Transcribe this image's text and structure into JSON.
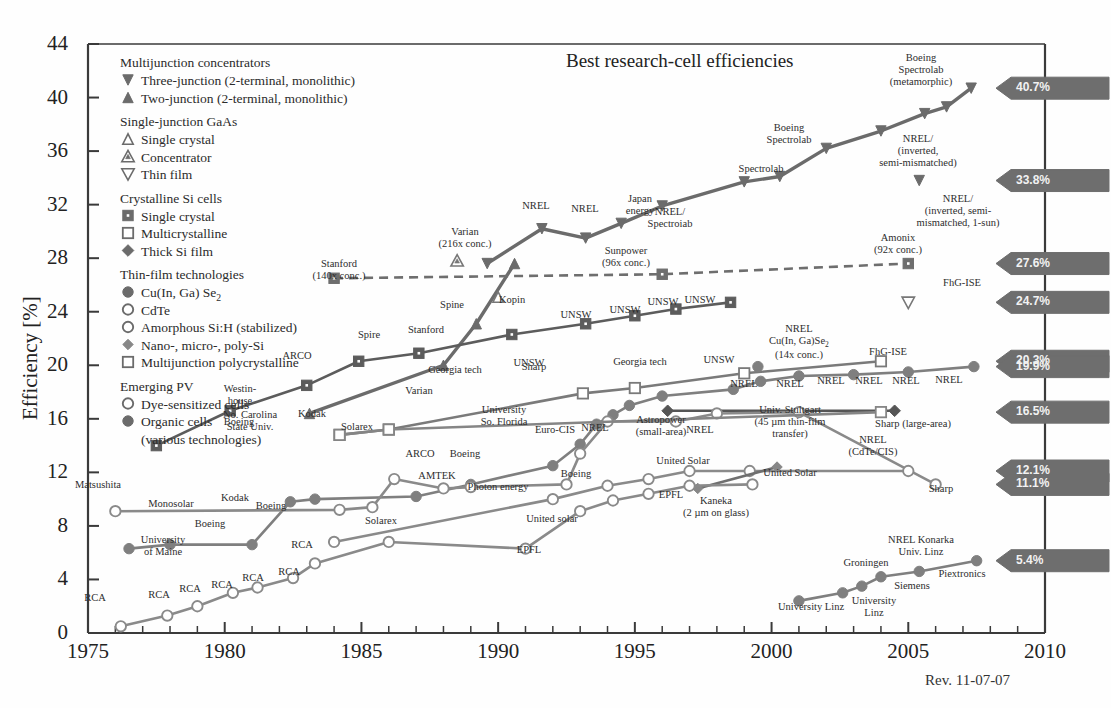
{
  "chart_data": {
    "type": "line",
    "title": "Best research-cell efficiencies",
    "xlabel": "",
    "ylabel": "Efficiency [%]",
    "xlim": [
      1975,
      2010
    ],
    "ylim": [
      0,
      44
    ],
    "xticks": [
      "1975",
      "1980",
      "1985",
      "1990",
      "1995",
      "2000",
      "2005",
      "2010"
    ],
    "yticks": [
      "0",
      "4",
      "8",
      "12",
      "16",
      "20",
      "24",
      "28",
      "32",
      "36",
      "40",
      "44"
    ],
    "revision": "Rev. 11-07-07",
    "grid": false,
    "legend_position": "upper-left-inside",
    "series": [
      {
        "name": "Three-junction (2-terminal, monolithic)",
        "marker": "triangle-down-filled",
        "color": "#6b6b6b",
        "points": [
          [
            1989.6,
            27.6
          ],
          [
            1991.6,
            30.2
          ],
          [
            1993.2,
            29.5
          ],
          [
            1994.5,
            30.6
          ],
          [
            1996.0,
            31.9
          ],
          [
            1999.0,
            33.7
          ],
          [
            2000.3,
            34.1
          ],
          [
            2002.0,
            36.2
          ],
          [
            2004.0,
            37.5
          ],
          [
            2005.6,
            38.8
          ],
          [
            2006.4,
            39.3
          ],
          [
            2007.3,
            40.7
          ],
          [
            2005.4,
            33.8
          ]
        ]
      },
      {
        "name": "Two-junction (2-terminal, monolithic)",
        "marker": "triangle-up-filled",
        "color": "#6b6b6b",
        "points": [
          [
            1983.1,
            16.4
          ],
          [
            1988.0,
            20.0
          ],
          [
            1989.2,
            23.1
          ],
          [
            1990.6,
            27.6
          ]
        ]
      },
      {
        "name": "Single crystal GaAs",
        "marker": "triangle-up-open",
        "color": "#777777",
        "points": [
          [
            1990.0,
            25.1
          ]
        ]
      },
      {
        "name": "GaAs Concentrator",
        "marker": "triangle-up-open-dot",
        "color": "#777777",
        "points": [
          [
            1988.5,
            27.8
          ]
        ]
      },
      {
        "name": "GaAs Thin film",
        "marker": "triangle-down-open",
        "color": "#777777",
        "points": [
          [
            2005.0,
            24.7
          ]
        ]
      },
      {
        "name": "Si Single crystal",
        "marker": "square-filled",
        "color": "#5c5c5c",
        "points": [
          [
            1977.5,
            14.0
          ],
          [
            1980.2,
            16.6
          ],
          [
            1983.0,
            18.5
          ],
          [
            1984.9,
            20.3
          ],
          [
            1987.1,
            20.9
          ],
          [
            1990.5,
            22.3
          ],
          [
            1993.2,
            23.1
          ],
          [
            1995.0,
            23.7
          ],
          [
            1996.5,
            24.2
          ],
          [
            1998.5,
            24.7
          ]
        ]
      },
      {
        "name": "Si Concentrator (dashed)",
        "marker": "square-filled",
        "color": "#6e6e6e",
        "style": "dashed",
        "points": [
          [
            1984.0,
            26.5
          ],
          [
            1996.0,
            26.8
          ],
          [
            2005.0,
            27.6
          ]
        ]
      },
      {
        "name": "Si Multicrystalline",
        "marker": "square-open",
        "color": "#7a7a7a",
        "points": [
          [
            1984.2,
            14.8
          ],
          [
            1986.0,
            15.2
          ],
          [
            1993.1,
            17.9
          ],
          [
            1995.0,
            18.3
          ],
          [
            1999.0,
            19.4
          ],
          [
            2004.0,
            20.3
          ]
        ]
      },
      {
        "name": "Thick Si film",
        "marker": "diamond-filled",
        "color": "#555555",
        "points": [
          [
            1996.2,
            16.6
          ],
          [
            2004.5,
            16.6
          ]
        ]
      },
      {
        "name": "Cu(In, Ga) Se2",
        "marker": "circle-filled",
        "color": "#7f7f7f",
        "points": [
          [
            1976.5,
            6.3
          ],
          [
            1978.0,
            6.6
          ],
          [
            1981.0,
            6.6
          ],
          [
            1982.4,
            9.8
          ],
          [
            1983.3,
            10.0
          ],
          [
            1987.0,
            10.2
          ],
          [
            1989.0,
            11.1
          ],
          [
            1992.0,
            12.5
          ],
          [
            1993.0,
            14.1
          ],
          [
            1993.6,
            15.6
          ],
          [
            1994.2,
            16.3
          ],
          [
            1994.8,
            17.0
          ],
          [
            1996.0,
            17.7
          ],
          [
            1998.6,
            18.2
          ],
          [
            1999.6,
            18.8
          ],
          [
            2001.0,
            19.2
          ],
          [
            2003.0,
            19.3
          ],
          [
            2005.0,
            19.5
          ],
          [
            2007.4,
            19.9
          ],
          [
            1999.5,
            19.9
          ]
        ]
      },
      {
        "name": "CdTe",
        "marker": "circle-open",
        "color": "#8a8a8a",
        "points": [
          [
            1976.0,
            9.1
          ],
          [
            1984.2,
            9.2
          ],
          [
            1985.4,
            9.4
          ],
          [
            1986.2,
            11.5
          ],
          [
            1988.0,
            10.8
          ],
          [
            1989.0,
            10.9
          ],
          [
            1992.5,
            11.1
          ],
          [
            1993.0,
            13.4
          ],
          [
            1994.0,
            15.8
          ],
          [
            1996.5,
            15.8
          ],
          [
            1998.0,
            16.4
          ],
          [
            2001.0,
            16.5
          ],
          [
            2006.0,
            11.1
          ]
        ]
      },
      {
        "name": "Amorphous Si:H (stabilized)",
        "marker": "circle-open",
        "color": "#8a8a8a",
        "points": [
          [
            1984.0,
            6.8
          ],
          [
            1992.0,
            10.0
          ],
          [
            1994.0,
            11.0
          ],
          [
            1995.5,
            11.5
          ],
          [
            1997.0,
            12.1
          ],
          [
            1999.2,
            12.1
          ],
          [
            2005.0,
            12.1
          ]
        ]
      },
      {
        "name": "Nano-, micro-, poly-Si",
        "marker": "diamond-filled-small",
        "color": "#6f6f6f",
        "points": [
          [
            1997.3,
            10.8
          ],
          [
            2000.2,
            12.4
          ]
        ]
      },
      {
        "name": "Multijunction polycrystalline",
        "marker": "square-open",
        "color": "#858585",
        "points": [
          [
            1984.2,
            14.8
          ],
          [
            1986.0,
            15.2
          ],
          [
            2004.0,
            16.5
          ]
        ]
      },
      {
        "name": "Dye-sensitized cells",
        "marker": "circle-open",
        "color": "#8a8a8a",
        "points": [
          [
            1976.2,
            0.5
          ],
          [
            1977.9,
            1.3
          ],
          [
            1979.0,
            2.0
          ],
          [
            1980.3,
            3.0
          ],
          [
            1981.2,
            3.4
          ],
          [
            1982.5,
            4.1
          ],
          [
            1983.3,
            5.2
          ],
          [
            1986.0,
            6.8
          ],
          [
            1991.0,
            6.3
          ],
          [
            1993.0,
            9.1
          ],
          [
            1994.2,
            9.9
          ],
          [
            1995.5,
            10.4
          ],
          [
            1997.0,
            11.0
          ],
          [
            1999.3,
            11.1
          ]
        ]
      },
      {
        "name": "Organic cells (various technologies)",
        "marker": "circle-filled",
        "color": "#7f7f7f",
        "points": [
          [
            2001.0,
            2.4
          ],
          [
            2002.6,
            3.0
          ],
          [
            2003.3,
            3.5
          ],
          [
            2004.0,
            4.2
          ],
          [
            2005.4,
            4.6
          ],
          [
            2007.5,
            5.4
          ]
        ]
      }
    ],
    "badges": [
      {
        "value": "40.7%",
        "y": 40.7
      },
      {
        "value": "33.8%",
        "y": 33.8
      },
      {
        "value": "27.6%",
        "y": 27.6
      },
      {
        "value": "24.7%",
        "y": 24.7
      },
      {
        "value": "20.3%",
        "y": 20.3
      },
      {
        "value": "19.9%",
        "y": 19.9
      },
      {
        "value": "16.5%",
        "y": 16.5
      },
      {
        "value": "12.1%",
        "y": 12.1
      },
      {
        "value": "11.1%",
        "y": 11.1
      },
      {
        "value": "5.4%",
        "y": 5.4
      }
    ],
    "annotations": [
      {
        "text": "Boeing\nSpectrolab\n(metamorphic)",
        "x": 921,
        "y": 52
      },
      {
        "text": "Boeing\nSpectrolab",
        "x": 789,
        "y": 122
      },
      {
        "text": "NREL/\n(inverted,\nsemi-mismatched)",
        "x": 918,
        "y": 133
      },
      {
        "text": "NREL/\n(inverted, semi-\nmismatched, 1-sun)",
        "x": 958,
        "y": 193
      },
      {
        "text": "Spectrolab",
        "x": 761,
        "y": 163
      },
      {
        "text": "NREL/\nSpectroiab",
        "x": 670,
        "y": 206
      },
      {
        "text": "Japan\nenergy",
        "x": 640,
        "y": 193
      },
      {
        "text": "NREL",
        "x": 585,
        "y": 203
      },
      {
        "text": "NREL",
        "x": 536,
        "y": 200
      },
      {
        "text": "Amonix\n(92x conc.)",
        "x": 898,
        "y": 232
      },
      {
        "text": "Sunpower\n(96x conc.)",
        "x": 626,
        "y": 245
      },
      {
        "text": "Varian\n(216x conc.)",
        "x": 465,
        "y": 226
      },
      {
        "text": "Stanford\n(140x conc.)",
        "x": 339,
        "y": 258
      },
      {
        "text": "FhG-ISE",
        "x": 962,
        "y": 277
      },
      {
        "text": "Kopin",
        "x": 512,
        "y": 294
      },
      {
        "text": "Spine",
        "x": 452,
        "y": 299
      },
      {
        "text": "UNSW",
        "x": 576,
        "y": 309
      },
      {
        "text": "UNSW",
        "x": 625,
        "y": 304
      },
      {
        "text": "UNSW",
        "x": 663,
        "y": 296
      },
      {
        "text": "UNSW",
        "x": 700,
        "y": 294
      },
      {
        "text": "Stanford",
        "x": 426,
        "y": 324
      },
      {
        "text": "Spire",
        "x": 369,
        "y": 329
      },
      {
        "text": "ARCO",
        "x": 297,
        "y": 350
      },
      {
        "text": "UNSW",
        "x": 529,
        "y": 357
      },
      {
        "text": "NREL\nCu(In, Ga)Se2\n(14x conc.)",
        "x": 799,
        "y": 323
      },
      {
        "text": "FhG-ISE",
        "x": 888,
        "y": 346
      },
      {
        "text": "Georgia tech",
        "x": 455,
        "y": 364
      },
      {
        "text": "Georgia tech",
        "x": 640,
        "y": 356
      },
      {
        "text": "Sharp",
        "x": 534,
        "y": 361
      },
      {
        "text": "UNSW",
        "x": 719,
        "y": 354
      },
      {
        "text": "NREL",
        "x": 949,
        "y": 374
      },
      {
        "text": "NREL",
        "x": 906,
        "y": 375
      },
      {
        "text": "NREL",
        "x": 869,
        "y": 375
      },
      {
        "text": "NREL",
        "x": 831,
        "y": 375
      },
      {
        "text": "NREL",
        "x": 790,
        "y": 378
      },
      {
        "text": "NREL",
        "x": 744,
        "y": 378
      },
      {
        "text": "Westin-\nhouse",
        "x": 240,
        "y": 383
      },
      {
        "text": "No. Carolina\nState Univ.",
        "x": 250,
        "y": 409
      },
      {
        "text": "Varian",
        "x": 419,
        "y": 385
      },
      {
        "text": "University\nSo. Florida",
        "x": 504,
        "y": 404
      },
      {
        "text": "NREL",
        "x": 595,
        "y": 422
      },
      {
        "text": "Euro-CIS",
        "x": 555,
        "y": 424
      },
      {
        "text": "Astropower\n(small-area)",
        "x": 661,
        "y": 414
      },
      {
        "text": "NREL",
        "x": 700,
        "y": 424
      },
      {
        "text": "Univ. Stultgart\n(45 µm thin-film\ntransfer)",
        "x": 790,
        "y": 404
      },
      {
        "text": "Sharp (large-area)",
        "x": 913,
        "y": 418
      },
      {
        "text": "NREL\n(CdTe/CIS)",
        "x": 873,
        "y": 434
      },
      {
        "text": "Solarex",
        "x": 357,
        "y": 421
      },
      {
        "text": "Kodak",
        "x": 312,
        "y": 408
      },
      {
        "text": "Boeing",
        "x": 239,
        "y": 416
      },
      {
        "text": "ARCO",
        "x": 420,
        "y": 448
      },
      {
        "text": "Boeing",
        "x": 465,
        "y": 448
      },
      {
        "text": "Boeing",
        "x": 576,
        "y": 468
      },
      {
        "text": "AMTEK",
        "x": 437,
        "y": 470
      },
      {
        "text": "Photon energy",
        "x": 498,
        "y": 481
      },
      {
        "text": "United Solar",
        "x": 683,
        "y": 455
      },
      {
        "text": "United Solar",
        "x": 790,
        "y": 467
      },
      {
        "text": "Sharp",
        "x": 941,
        "y": 483
      },
      {
        "text": "Matsushita",
        "x": 98,
        "y": 479
      },
      {
        "text": "Monosolar",
        "x": 171,
        "y": 498
      },
      {
        "text": "Kodak",
        "x": 235,
        "y": 492
      },
      {
        "text": "Boeing",
        "x": 271,
        "y": 500
      },
      {
        "text": "Boeing",
        "x": 210,
        "y": 518
      },
      {
        "text": "Solarex",
        "x": 381,
        "y": 515
      },
      {
        "text": "United solar",
        "x": 552,
        "y": 513
      },
      {
        "text": "EPFL",
        "x": 671,
        "y": 489
      },
      {
        "text": "Kaneka\n(2 µm on glass)",
        "x": 716,
        "y": 495
      },
      {
        "text": "University\nof Maine",
        "x": 163,
        "y": 534
      },
      {
        "text": "EPFL",
        "x": 529,
        "y": 544
      },
      {
        "text": "RCA",
        "x": 302,
        "y": 539
      },
      {
        "text": "RCA",
        "x": 289,
        "y": 566
      },
      {
        "text": "RCA",
        "x": 253,
        "y": 572
      },
      {
        "text": "RCA",
        "x": 222,
        "y": 579
      },
      {
        "text": "RCA",
        "x": 190,
        "y": 583
      },
      {
        "text": "RCA",
        "x": 159,
        "y": 589
      },
      {
        "text": "RCA",
        "x": 95,
        "y": 592
      },
      {
        "text": "NREL Konarka\nUniv. Linz",
        "x": 921,
        "y": 534
      },
      {
        "text": "Groningen",
        "x": 866,
        "y": 557
      },
      {
        "text": "Siemens",
        "x": 912,
        "y": 580
      },
      {
        "text": "Piextronics",
        "x": 962,
        "y": 568
      },
      {
        "text": "University Linz",
        "x": 811,
        "y": 601
      },
      {
        "text": "University\nLinz",
        "x": 874,
        "y": 595
      }
    ]
  },
  "legend": {
    "groups": [
      {
        "heading": "Multijunction concentrators",
        "items": [
          {
            "marker": "triangle-down-filled",
            "label": "Three-junction (2-terminal, monolithic)"
          },
          {
            "marker": "triangle-up-filled",
            "label": "Two-junction (2-terminal, monolithic)"
          }
        ]
      },
      {
        "heading": "Single-junction GaAs",
        "items": [
          {
            "marker": "triangle-up-open",
            "label": "Single crystal"
          },
          {
            "marker": "triangle-up-open-dot",
            "label": "Concentrator"
          },
          {
            "marker": "triangle-down-open",
            "label": "Thin film"
          }
        ]
      },
      {
        "heading": "Crystalline Si cells",
        "items": [
          {
            "marker": "square-filled",
            "label": "Single crystal"
          },
          {
            "marker": "square-open",
            "label": "Multicrystalline"
          },
          {
            "marker": "diamond-filled",
            "label": "Thick Si film"
          }
        ]
      },
      {
        "heading": "Thin-film technologies",
        "items": [
          {
            "marker": "circle-filled",
            "label": "Cu(In, Ga) Se₂"
          },
          {
            "marker": "circle-open",
            "label": "CdTe"
          },
          {
            "marker": "circle-open",
            "label": "Amorphous Si:H (stabilized)"
          },
          {
            "marker": "diamond-filled-small",
            "label": "Nano-, micro-, poly-Si"
          },
          {
            "marker": "square-open",
            "label": "Multijunction polycrystalline"
          }
        ]
      },
      {
        "heading": "Emerging PV",
        "items": [
          {
            "marker": "circle-open",
            "label": "Dye-sensitized cells"
          },
          {
            "marker": "circle-filled",
            "label": "Organic cells"
          },
          {
            "marker": "none",
            "label": "(various technologies)"
          }
        ]
      }
    ]
  },
  "colors": {
    "axis": "#3a3a3a",
    "badge": "#6e6e6e",
    "badge_text": "#f2f2f2",
    "line_dark": "#5c5c5c",
    "line_mid": "#7a7a7a",
    "line_light": "#8f8f8f",
    "text": "#2b2b2b",
    "background": "#fefefe"
  }
}
